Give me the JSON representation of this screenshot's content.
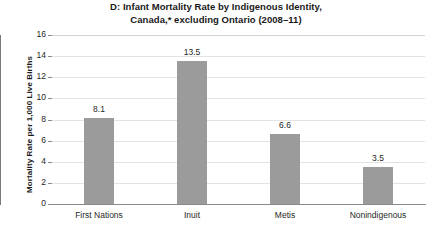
{
  "chart_data": {
    "type": "bar",
    "title": "D: Infant Mortality Rate by Indigenous Identity, Canada,* excluding Ontario (2008–11)",
    "title_lines": [
      "D: Infant Mortality Rate by Indigenous Identity,",
      "Canada,* excluding Ontario (2008–11)"
    ],
    "categories": [
      "First Nations",
      "Inuit",
      "Metis",
      "Nonindigenous"
    ],
    "values": [
      8.1,
      13.5,
      6.6,
      3.5
    ],
    "value_labels": [
      "8.1",
      "13.5",
      "6.6",
      "3.5"
    ],
    "xlabel": "",
    "ylabel": "Mortality Rate per 1,000 Live Births",
    "ylim": [
      0,
      16
    ],
    "ytick_values": [
      0,
      2,
      4,
      6,
      8,
      10,
      12,
      14,
      16
    ],
    "ytick_labels": [
      "0",
      "2",
      "4",
      "6",
      "8",
      "10",
      "12",
      "14",
      "16"
    ],
    "grid": true,
    "legend": false,
    "legend_position": "none",
    "bar_color": "#9b9b9b",
    "gridline_color": "#e3e3e3",
    "axis_color": "#8a8a8a",
    "text_color": "#1f1f1f",
    "background_color": "#ffffff"
  }
}
